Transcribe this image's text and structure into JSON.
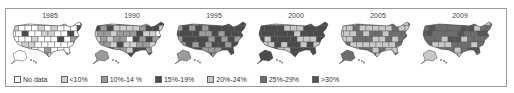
{
  "figure": {
    "panels": [
      {
        "year": "1985",
        "left": 8,
        "mix": [
          0.55,
          0.25,
          0.12,
          0.08,
          0,
          0,
          0
        ]
      },
      {
        "year": "1990",
        "left": 90,
        "mix": [
          0.02,
          0.15,
          0.45,
          0.38,
          0,
          0,
          0
        ]
      },
      {
        "year": "1995",
        "left": 172,
        "mix": [
          0,
          0,
          0.3,
          0.7,
          0,
          0,
          0
        ]
      },
      {
        "year": "2000",
        "left": 254,
        "mix": [
          0,
          0,
          0,
          0.6,
          0.4,
          0,
          0
        ]
      },
      {
        "year": "2005",
        "left": 336,
        "mix": [
          0,
          0,
          0,
          0,
          0.55,
          0.45,
          0
        ]
      },
      {
        "year": "2009",
        "left": 418,
        "mix": [
          0,
          0,
          0,
          0,
          0.2,
          0.55,
          0.25
        ]
      }
    ]
  },
  "legend": {
    "items": [
      {
        "label": "No data",
        "color": "#ffffff"
      },
      {
        "label": "<10%",
        "color": "#cfcfcf"
      },
      {
        "label": "10%-14 %",
        "color": "#9b9b9b"
      },
      {
        "label": "15%-19%",
        "color": "#4a4a4a"
      },
      {
        "label": "20%-24%",
        "color": "#c8c8c8"
      },
      {
        "label": "25%-29%",
        "color": "#6e6e6e"
      },
      {
        "label": ">30%",
        "color": "#555555"
      }
    ]
  },
  "chart_data": {
    "type": "heatmap",
    "title": "",
    "categories": [
      "1985",
      "1990",
      "1995",
      "2000",
      "2005",
      "2009"
    ],
    "legend": [
      "No data",
      "<10%",
      "10%-14 %",
      "15%-19%",
      "20%-24%",
      "25%-29%",
      ">30%"
    ]
  }
}
